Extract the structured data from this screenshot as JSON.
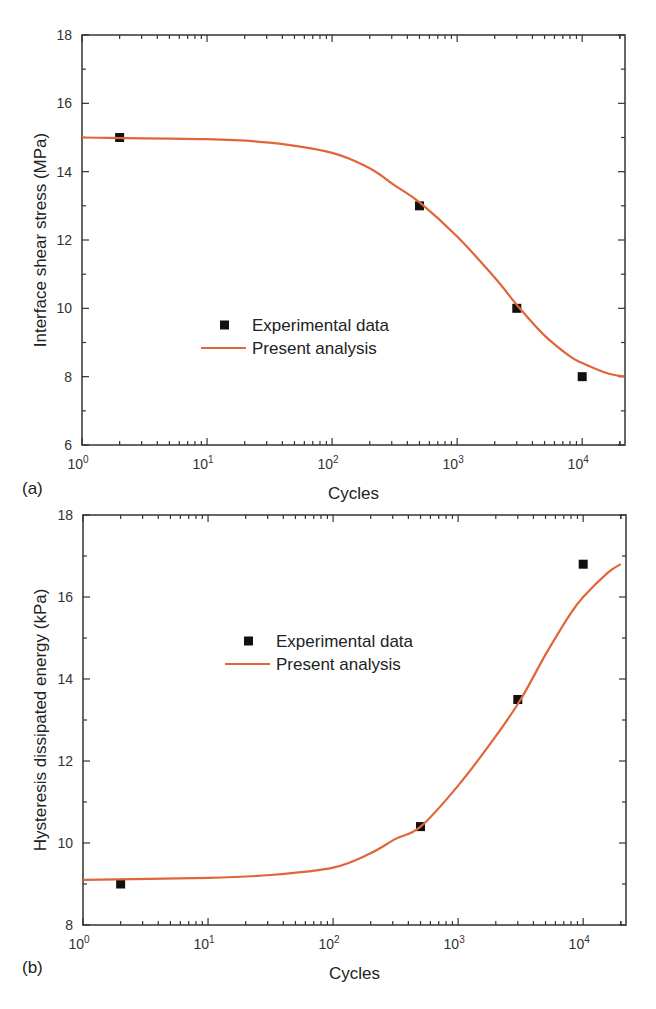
{
  "colors": {
    "curve": "#e0663a",
    "marker": "#111111",
    "axis": "#333333"
  },
  "chart_data": [
    {
      "type": "scatter",
      "panel_label": "(a)",
      "title": "",
      "xlabel": "Cycles",
      "ylabel": "Interface shear stress (MPa)",
      "xscale": "log",
      "xlim": [
        1,
        22000
      ],
      "ylim": [
        6,
        18
      ],
      "yticks": [
        6,
        8,
        10,
        12,
        14,
        16,
        18
      ],
      "xtick_labels": [
        {
          "base": "10",
          "exp": "0",
          "value": 1
        },
        {
          "base": "10",
          "exp": "1",
          "value": 10
        },
        {
          "base": "10",
          "exp": "2",
          "value": 100
        },
        {
          "base": "10",
          "exp": "3",
          "value": 1000
        },
        {
          "base": "10",
          "exp": "4",
          "value": 10000
        }
      ],
      "legend": [
        {
          "label": "Experimental data",
          "kind": "marker"
        },
        {
          "label": "Present analysis",
          "kind": "line"
        }
      ],
      "series": [
        {
          "name": "Experimental data",
          "kind": "marker",
          "x": [
            2,
            500,
            3000,
            10000
          ],
          "y": [
            15.0,
            13.0,
            10.0,
            8.0
          ]
        },
        {
          "name": "Present analysis",
          "kind": "line",
          "log_x": [
            0,
            1,
            1.5,
            2,
            2.3,
            2.5,
            2.7,
            3,
            3.3,
            3.5,
            3.7,
            3.9,
            4.0,
            4.2,
            4.34
          ],
          "y": [
            15.0,
            14.95,
            14.85,
            14.55,
            14.1,
            13.6,
            13.1,
            12.1,
            10.9,
            10.0,
            9.2,
            8.6,
            8.4,
            8.1,
            8.0
          ]
        }
      ],
      "layout": {
        "left": 82,
        "top": 35,
        "right": 625,
        "bottom": 445,
        "legend_x": 201,
        "legend_y": 325,
        "xlabel_y": 499,
        "ylabel_x": 46,
        "panel_label_x": 22,
        "panel_label_y": 494
      }
    },
    {
      "type": "scatter",
      "panel_label": "(b)",
      "title": "",
      "xlabel": "Cycles",
      "ylabel": "Hysteresis dissipated energy (kPa)",
      "xscale": "log",
      "xlim": [
        1,
        22000
      ],
      "ylim": [
        8,
        18
      ],
      "yticks": [
        8,
        10,
        12,
        14,
        16,
        18
      ],
      "xtick_labels": [
        {
          "base": "10",
          "exp": "0",
          "value": 1
        },
        {
          "base": "10",
          "exp": "1",
          "value": 10
        },
        {
          "base": "10",
          "exp": "2",
          "value": 100
        },
        {
          "base": "10",
          "exp": "3",
          "value": 1000
        },
        {
          "base": "10",
          "exp": "4",
          "value": 10000
        }
      ],
      "legend": [
        {
          "label": "Experimental data",
          "kind": "marker"
        },
        {
          "label": "Present analysis",
          "kind": "line"
        }
      ],
      "series": [
        {
          "name": "Experimental data",
          "kind": "marker",
          "x": [
            2,
            500,
            3000,
            10000
          ],
          "y": [
            9.0,
            10.4,
            13.5,
            16.8
          ]
        },
        {
          "name": "Present analysis",
          "kind": "line",
          "log_x": [
            0,
            1,
            1.5,
            2,
            2.3,
            2.5,
            2.7,
            3,
            3.3,
            3.5,
            3.7,
            3.9,
            4.0,
            4.2,
            4.3
          ],
          "y": [
            9.1,
            9.15,
            9.22,
            9.4,
            9.75,
            10.1,
            10.4,
            11.4,
            12.6,
            13.5,
            14.6,
            15.6,
            16.0,
            16.6,
            16.8
          ]
        }
      ],
      "layout": {
        "left": 83,
        "top": 515,
        "right": 626,
        "bottom": 925,
        "legend_x": 225,
        "legend_y": 641,
        "xlabel_y": 979,
        "ylabel_x": 46,
        "panel_label_x": 22,
        "panel_label_y": 973
      }
    }
  ]
}
